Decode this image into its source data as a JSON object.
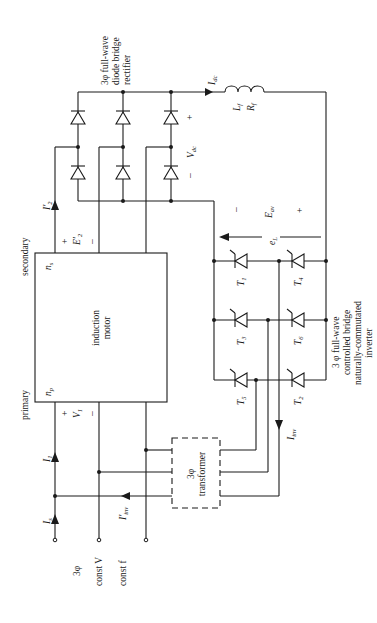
{
  "diagram": {
    "labels": {
      "rectifier": [
        "3φ full-wave",
        "diode bridge",
        "rectifier"
      ],
      "inverter": [
        "3 φ full-wave",
        "controlled bridge",
        "naturally-commutated",
        "inverter"
      ],
      "motor": [
        "induction",
        "motor"
      ],
      "transformer": [
        "3φ",
        "transformer"
      ],
      "primary": "primary",
      "secondary": "secondary",
      "n_s": "n",
      "n_s_sub": "s",
      "n_p": "n",
      "n_p_sub": "p",
      "supply": [
        "3φ",
        "const V",
        "const f"
      ],
      "I_dc": "I",
      "I_dc_sub": "dc",
      "L_f": "L",
      "L_f_sub": "f",
      "R_f": "R",
      "R_f_sub": "f",
      "V_dc": "V",
      "V_dc_sub": "dc",
      "E_av": "E",
      "E_av_sub": "av",
      "e_L": "e",
      "e_L_sub": "L",
      "I2p": "I′",
      "I2p_sub": "2",
      "E2p": "E′",
      "E2p_sub": "2",
      "V1": "V",
      "V1_sub": "1",
      "I1": "I",
      "I1_sub": "1",
      "Is": "I",
      "Is_sub": "s",
      "Iinvp": "I′",
      "Iinvp_sub": "inv",
      "Iinv": "I",
      "Iinv_sub": "inv",
      "plus": "+",
      "minus": "–"
    },
    "thyristors": [
      {
        "name": "T",
        "sub": "1"
      },
      {
        "name": "T",
        "sub": "4"
      },
      {
        "name": "T",
        "sub": "3"
      },
      {
        "name": "T",
        "sub": "6"
      },
      {
        "name": "T",
        "sub": "5"
      },
      {
        "name": "T",
        "sub": "2"
      }
    ]
  }
}
